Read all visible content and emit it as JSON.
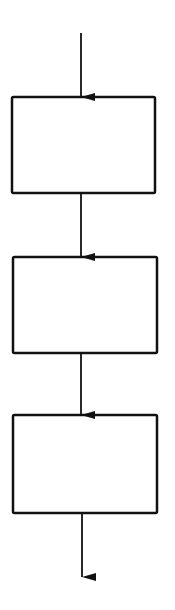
{
  "diagram": {
    "type": "flowchart",
    "orientation": "vertical",
    "stroke_color": "#111111",
    "background": "#ffffff",
    "boxes": [
      {
        "id": "box-1",
        "label": "",
        "x": 12,
        "y": 97,
        "w": 143,
        "h": 96
      },
      {
        "id": "box-2",
        "label": "",
        "x": 13,
        "y": 257,
        "w": 144,
        "h": 96
      },
      {
        "id": "box-3",
        "label": "",
        "x": 13,
        "y": 415,
        "w": 144,
        "h": 98
      }
    ],
    "arrows": [
      {
        "id": "arrow-in",
        "x": 81,
        "y1": 33,
        "y2": 97
      },
      {
        "id": "arrow-1-2",
        "x": 81,
        "y1": 193,
        "y2": 257
      },
      {
        "id": "arrow-2-3",
        "x": 81,
        "y1": 353,
        "y2": 415
      },
      {
        "id": "arrow-out",
        "x": 82,
        "y1": 513,
        "y2": 577
      }
    ]
  }
}
